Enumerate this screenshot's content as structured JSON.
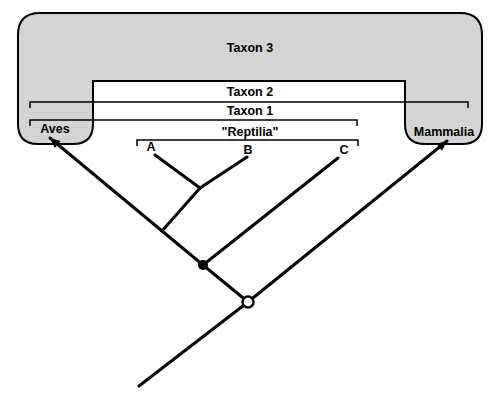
{
  "diagram": {
    "type": "cladogram",
    "group_labels": {
      "taxon3": "Taxon 3",
      "taxon2": "Taxon 2",
      "taxon1": "Taxon 1",
      "reptilia": "\"Reptilia\""
    },
    "tip_labels": {
      "aves": "Aves",
      "a": "A",
      "b": "B",
      "c": "C",
      "mammalia": "Mammalia"
    },
    "nodes": {
      "taxon1_ancestor_marker": "filled-circle",
      "taxon2_ancestor_marker": "open-circle"
    },
    "colors": {
      "shade": "#d4d4d4",
      "line": "#000000",
      "background": "#ffffff"
    }
  }
}
